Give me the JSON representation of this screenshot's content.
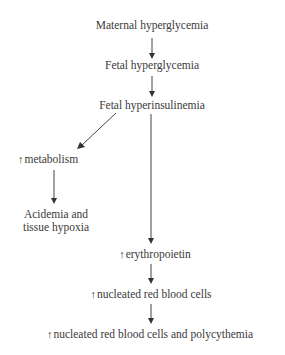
{
  "diagram": {
    "type": "flowchart",
    "nodes": {
      "maternal_hyperglycemia": "Maternal hyperglycemia",
      "fetal_hyperglycemia": "Fetal hyperglycemia",
      "fetal_hyperinsulinemia": "Fetal hyperinsulinemia",
      "metabolism": "metabolism",
      "acidemia_line1": "Acidemia and",
      "acidemia_line2": "tissue hypoxia",
      "erythropoietin": "erythropoietin",
      "nrbc": "nucleated red blood cells",
      "nrbc_polycythemia": "nucleated red blood cells and polycythemia"
    },
    "increase_symbol": "↑",
    "edges": [
      {
        "from": "Maternal hyperglycemia",
        "to": "Fetal hyperglycemia"
      },
      {
        "from": "Fetal hyperglycemia",
        "to": "Fetal hyperinsulinemia"
      },
      {
        "from": "Fetal hyperinsulinemia",
        "to": "↑ metabolism"
      },
      {
        "from": "Fetal hyperinsulinemia",
        "to": "↑ erythropoietin"
      },
      {
        "from": "↑ metabolism",
        "to": "Acidemia and tissue hypoxia"
      },
      {
        "from": "↑ erythropoietin",
        "to": "↑ nucleated red blood cells"
      },
      {
        "from": "↑ nucleated red blood cells",
        "to": "↑ nucleated red blood cells and polycythemia"
      }
    ],
    "line_color": "#444444"
  }
}
